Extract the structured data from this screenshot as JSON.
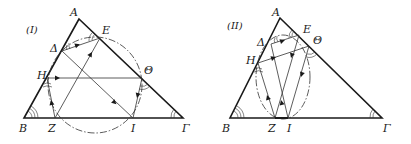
{
  "figures": [
    {
      "tag": "(I)",
      "vertices": {
        "A": "A",
        "B": "B",
        "Gamma": "Γ"
      },
      "points": {
        "E": "E",
        "Delta": "Δ",
        "H": "H",
        "Theta": "Θ",
        "Z": "Z",
        "I": "I"
      },
      "curve": "dashed circle"
    },
    {
      "tag": "(II)",
      "vertices": {
        "A": "A",
        "B": "B",
        "Gamma": "Γ"
      },
      "points": {
        "E": "E",
        "Delta": "Δ",
        "H": "H",
        "Theta": "Θ",
        "Z": "Z",
        "I": "I"
      },
      "curve": "dashed ellipse"
    }
  ],
  "colors": {
    "stroke": "#1a1a1a",
    "thin": "#333333"
  }
}
